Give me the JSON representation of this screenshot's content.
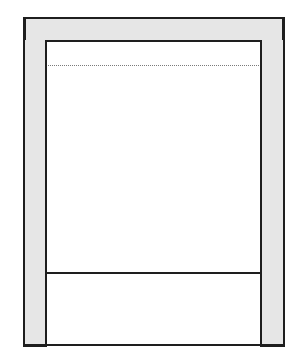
{
  "diagram": {
    "type": "frame-elevation-line-drawing",
    "colors": {
      "line": "#1e1e1e",
      "frame_fill": "#e6e6e6",
      "panel_fill": "#ffffff",
      "dotted_line": "#7a7a7a"
    },
    "parts": [
      {
        "name": "top-rail",
        "fill": "shaded"
      },
      {
        "name": "left-stile",
        "fill": "shaded"
      },
      {
        "name": "right-stile",
        "fill": "shaded"
      },
      {
        "name": "upper-panel",
        "fill": "white"
      },
      {
        "name": "dotted-guide-line",
        "style": "dotted"
      },
      {
        "name": "lower-panel",
        "fill": "white"
      }
    ],
    "labels": []
  }
}
